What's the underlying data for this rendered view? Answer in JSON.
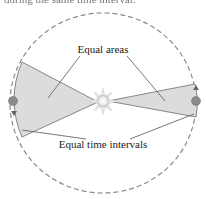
{
  "caption_fragment": "during the same time interval.",
  "labels": {
    "equal_areas": "Equal areas",
    "equal_time_intervals": "Equal time intervals"
  },
  "colors": {
    "orbit": "#888888",
    "wedge_fill": "#d9d9d9",
    "wedge_stroke": "#777777",
    "sun": "#f2f2f2",
    "planet": "#888888",
    "leader": "#555555"
  }
}
